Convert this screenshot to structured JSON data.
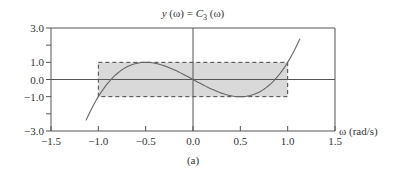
{
  "chart_data": {
    "type": "line",
    "title": "y (ω) = C3 (ω)",
    "title_parts": {
      "prefix": "y (ω) = C",
      "subscript": "3",
      "suffix": " (ω)"
    },
    "xlabel": "ω (rad/s)",
    "ylabel": "",
    "caption": "(a)",
    "xlim": [
      -1.5,
      1.5
    ],
    "ylim": [
      -3.0,
      3.0
    ],
    "x_ticks": [
      -1.5,
      -1.0,
      -0.5,
      0.0,
      0.5,
      1.0,
      1.5
    ],
    "x_tick_labels": [
      "−1.5",
      "−1.0",
      "−0.5",
      "0.0",
      "0.5",
      "1.0",
      "1.5"
    ],
    "y_ticks": [
      3.0,
      2.0,
      1.0,
      0.0,
      -1.0,
      -2.0,
      -3.0
    ],
    "y_tick_labels": [
      "3.0",
      "",
      "1.0",
      "0.0",
      "−1.0",
      "",
      "−3.0"
    ],
    "grid": false,
    "legend": null,
    "shaded_region": {
      "x": [
        -1.0,
        1.0
      ],
      "y": [
        -1.0,
        1.0
      ],
      "fill": "#d9d9d9",
      "border": "dashed"
    },
    "series": [
      {
        "name": "C3(ω) = 4ω³ − 3ω",
        "x": [
          -1.13,
          -1.0,
          -0.866,
          -0.75,
          -0.5,
          -0.25,
          0.0,
          0.25,
          0.5,
          0.75,
          0.866,
          1.0,
          1.13
        ],
        "y": [
          -2.38,
          -1.0,
          0.0,
          0.56,
          1.0,
          0.69,
          0.0,
          -0.69,
          -1.0,
          -0.56,
          0.0,
          1.0,
          2.38
        ]
      }
    ]
  },
  "colors": {
    "axis": "#555555",
    "curve": "#666666",
    "shade": "#d9d9d9",
    "dash": "#444444"
  }
}
